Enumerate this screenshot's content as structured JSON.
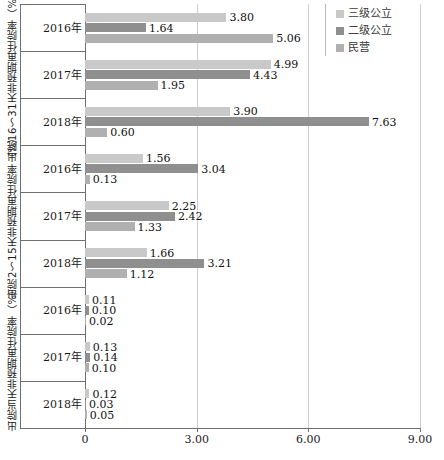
{
  "chart_data": {
    "type": "bar",
    "orientation": "horizontal",
    "title": "",
    "xlabel": "",
    "ylabel": "",
    "xlim": [
      0,
      9
    ],
    "xticks": [
      "0",
      "3.00",
      "6.00",
      "9.00"
    ],
    "xtick_values": [
      0,
      3,
      6,
      9
    ],
    "grid": true,
    "legend_position": "top-right",
    "series": [
      {
        "name": "三级公立",
        "color": "#c9c9c9"
      },
      {
        "name": "二级公立",
        "color": "#8f8f8f"
      },
      {
        "name": "民营",
        "color": "#b0b0b0"
      }
    ],
    "panels": [
      {
        "label": "出院16～31天非预期再住院率（%）",
        "categories": [
          "2016年",
          "2017年",
          "2018年"
        ],
        "values": [
          [
            3.8,
            1.64,
            5.06
          ],
          [
            4.99,
            4.43,
            1.95
          ],
          [
            3.9,
            7.63,
            0.6
          ]
        ],
        "value_labels": [
          [
            "3.80",
            "1.64",
            "5.06"
          ],
          [
            "4.99",
            "4.43",
            "1.95"
          ],
          [
            "3.90",
            "7.63",
            "0.60"
          ]
        ]
      },
      {
        "label": "出院2～15天非预期再住院率（%）",
        "categories": [
          "2016年",
          "2017年",
          "2018年"
        ],
        "values": [
          [
            1.56,
            3.04,
            0.13
          ],
          [
            2.25,
            2.42,
            1.33
          ],
          [
            1.66,
            3.21,
            1.12
          ]
        ],
        "value_labels": [
          [
            "1.56",
            "3.04",
            "0.13"
          ],
          [
            "2.25",
            "2.42",
            "1.33"
          ],
          [
            "1.66",
            "3.21",
            "1.12"
          ]
        ]
      },
      {
        "label": "出院当天非预期再住院率（%）",
        "categories": [
          "2016年",
          "2017年",
          "2018年"
        ],
        "values": [
          [
            0.11,
            0.1,
            0.02
          ],
          [
            0.13,
            0.14,
            0.1
          ],
          [
            0.12,
            0.03,
            0.05
          ]
        ],
        "value_labels": [
          [
            "0.11",
            "0.10",
            "0.02"
          ],
          [
            "0.13",
            "0.14",
            "0.10"
          ],
          [
            "0.12",
            "0.03",
            "0.05"
          ]
        ]
      }
    ]
  },
  "legend": {
    "items": [
      {
        "label": "三级公立",
        "color": "#c9c9c9"
      },
      {
        "label": "二级公立",
        "color": "#8f8f8f"
      },
      {
        "label": "民营",
        "color": "#b0b0b0"
      }
    ]
  }
}
